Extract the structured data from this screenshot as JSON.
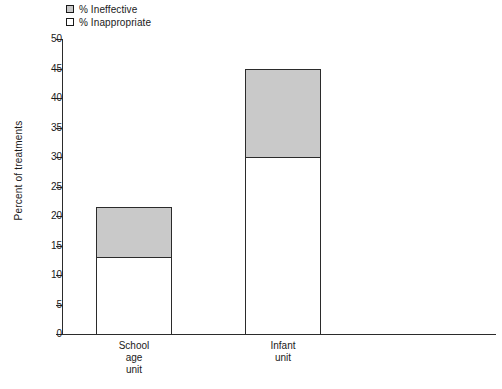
{
  "chart_data": {
    "type": "bar",
    "subtype": "stacked-bar",
    "title": "",
    "xlabel": "",
    "ylabel": "Percent of treatments",
    "ylim": [
      0,
      50
    ],
    "ytick_step": 5,
    "yticks": [
      "50",
      "45",
      "40",
      "35",
      "30",
      "25",
      "20",
      "15",
      "10",
      "5",
      "0"
    ],
    "grid": false,
    "legend_position": "top-left",
    "categories": [
      "School\nage\nunit",
      "Infant\nunit"
    ],
    "category_labels_flat": [
      "School age unit",
      "Infant unit"
    ],
    "series": [
      {
        "name": "% Inappropriate",
        "swatch": "white",
        "color": "#ffffff",
        "values": [
          13,
          30
        ]
      },
      {
        "name": "% Ineffective",
        "swatch": "grey",
        "color": "#c9c9c9",
        "values": [
          8.5,
          15
        ]
      }
    ],
    "totals": [
      21.5,
      45
    ],
    "stack_order_bottom_to_top": [
      "% Inappropriate",
      "% Ineffective"
    ]
  },
  "legend": {
    "items": [
      {
        "label": "% Ineffective",
        "color": "#c9c9c9"
      },
      {
        "label": "% Inappropriate",
        "color": "#ffffff"
      }
    ]
  },
  "axes": {
    "y_title": "Percent of treatments",
    "y_ticks": [
      "50",
      "45",
      "40",
      "35",
      "30",
      "25",
      "20",
      "15",
      "10",
      "5",
      "0"
    ],
    "x_categories": [
      "School\nage\nunit",
      "Infant\nunit"
    ]
  },
  "colors": {
    "ineffective": "#c9c9c9",
    "inappropriate": "#ffffff",
    "axis": "#2b2b2b",
    "text": "#1a1a1a",
    "background": "#ffffff"
  }
}
